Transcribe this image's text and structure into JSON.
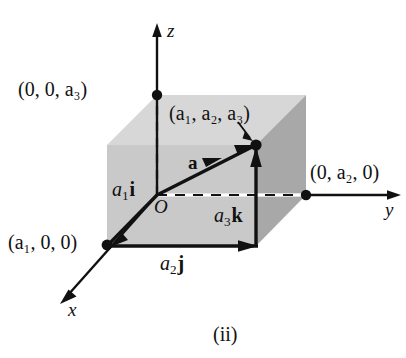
{
  "figure": {
    "caption": "(ii)",
    "colors": {
      "ink": "#111111",
      "face_front": "#c9c9c9",
      "face_top": "#d7d7d7",
      "face_side": "#a8a8a8",
      "background": "#ffffff"
    }
  },
  "axes": [
    {
      "id": "z",
      "name": "z"
    },
    {
      "id": "y",
      "name": "y"
    },
    {
      "id": "x",
      "name": "x"
    }
  ],
  "origin": {
    "name": "O"
  },
  "vector": {
    "name": "a"
  },
  "points": [
    {
      "id": "z-intercept",
      "label": "(0, 0, a₃)"
    },
    {
      "id": "vector-tip",
      "label": "(a₁, a₂, a₃)"
    },
    {
      "id": "y-intercept",
      "label": "(0, a₂, 0)"
    },
    {
      "id": "x-intercept",
      "label": "(a₁, 0, 0)"
    }
  ],
  "components": [
    {
      "id": "x-component",
      "scalar": "a",
      "index": "1",
      "unit": "i"
    },
    {
      "id": "y-component",
      "scalar": "a",
      "index": "2",
      "unit": "j"
    },
    {
      "id": "z-component",
      "scalar": "a",
      "index": "3",
      "unit": "k"
    }
  ]
}
